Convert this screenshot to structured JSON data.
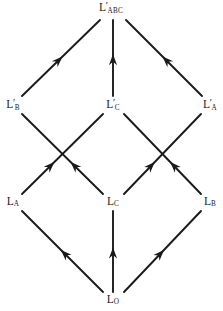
{
  "figure": {
    "type": "lattice-diagram",
    "background_color": "#ffffff",
    "stroke_color": "#1a1a1a",
    "text_color": "#1a1a1a",
    "width": 223,
    "height": 311
  },
  "nodes": [
    {
      "id": "L_ABC_prime",
      "base": "L",
      "prime": "′",
      "sub": "ABC",
      "has_prime": true,
      "x": 111,
      "y": 8,
      "level": 3
    },
    {
      "id": "L_B_prime",
      "base": "L",
      "prime": "′",
      "sub": "B",
      "has_prime": true,
      "x": 13,
      "y": 105,
      "level": 2
    },
    {
      "id": "L_C_prime",
      "base": "L",
      "prime": "′",
      "sub": "C",
      "has_prime": true,
      "x": 113,
      "y": 105,
      "level": 2
    },
    {
      "id": "L_A_prime",
      "base": "L",
      "prime": "′",
      "sub": "A",
      "has_prime": true,
      "x": 210,
      "y": 105,
      "level": 2
    },
    {
      "id": "L_A",
      "base": "L",
      "prime": "",
      "sub": "A",
      "has_prime": false,
      "x": 13,
      "y": 202,
      "level": 1
    },
    {
      "id": "L_C",
      "base": "L",
      "prime": "",
      "sub": "C",
      "has_prime": false,
      "x": 113,
      "y": 202,
      "level": 1
    },
    {
      "id": "L_B",
      "base": "L",
      "prime": "",
      "sub": "B",
      "has_prime": false,
      "x": 210,
      "y": 202,
      "level": 1
    },
    {
      "id": "L_O",
      "base": "L",
      "prime": "",
      "sub": "O",
      "has_prime": false,
      "x": 113,
      "y": 300,
      "level": 0
    }
  ],
  "edges": [
    {
      "id": "e-LB1-LABC",
      "from": "L_B_prime",
      "to": "L_ABC_prime",
      "x1": 22,
      "y1": 96,
      "x2": 100,
      "y2": 20,
      "arrow_at": 0.52
    },
    {
      "id": "e-LC1-LABC",
      "from": "L_C_prime",
      "to": "L_ABC_prime",
      "x1": 113,
      "y1": 96,
      "x2": 113,
      "y2": 20,
      "arrow_at": 0.55
    },
    {
      "id": "e-LA1-LABC",
      "from": "L_A_prime",
      "to": "L_ABC_prime",
      "x1": 202,
      "y1": 96,
      "x2": 126,
      "y2": 20,
      "arrow_at": 0.52
    },
    {
      "id": "e-LA-LC1",
      "from": "L_A",
      "to": "L_C_prime",
      "x1": 22,
      "y1": 194,
      "x2": 103,
      "y2": 114,
      "arrow_at": 0.4
    },
    {
      "id": "e-LC-LB1",
      "from": "L_C",
      "to": "L_B_prime",
      "x1": 103,
      "y1": 194,
      "x2": 22,
      "y2": 114,
      "arrow_at": 0.4
    },
    {
      "id": "e-LC-LA1",
      "from": "L_C",
      "to": "L_A_prime",
      "x1": 124,
      "y1": 194,
      "x2": 201,
      "y2": 114,
      "arrow_at": 0.4
    },
    {
      "id": "e-LB-LC1",
      "from": "L_B",
      "to": "L_C_prime",
      "x1": 201,
      "y1": 194,
      "x2": 124,
      "y2": 114,
      "arrow_at": 0.4
    },
    {
      "id": "e-LO-LA",
      "from": "L_O",
      "to": "L_A",
      "x1": 103,
      "y1": 292,
      "x2": 22,
      "y2": 211,
      "arrow_at": 0.52
    },
    {
      "id": "e-LO-LC",
      "from": "L_O",
      "to": "L_C",
      "x1": 113,
      "y1": 292,
      "x2": 113,
      "y2": 211,
      "arrow_at": 0.55
    },
    {
      "id": "e-LO-LB",
      "from": "L_O",
      "to": "L_B",
      "x1": 124,
      "y1": 292,
      "x2": 201,
      "y2": 211,
      "arrow_at": 0.52
    }
  ]
}
